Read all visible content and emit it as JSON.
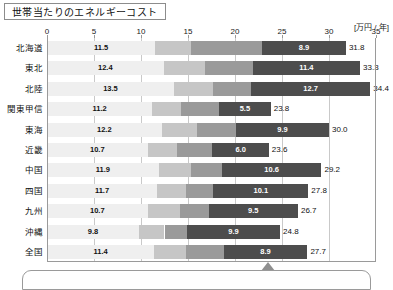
{
  "title": "世帯当たりのエネルギーコスト",
  "unit_label": "[万円 / 年]",
  "axis": {
    "ticks": [
      "0",
      "5",
      "10",
      "15",
      "20",
      "25",
      "30",
      "35"
    ],
    "min": 0,
    "max": 35
  },
  "chart_data": {
    "type": "bar",
    "orientation": "horizontal",
    "stacked": true,
    "title": "世帯当たりのエネルギーコスト",
    "xlabel": "[万円 / 年]",
    "ylabel": "",
    "xlim": [
      0,
      35
    ],
    "xticks": [
      0,
      5,
      10,
      15,
      20,
      25,
      30,
      35
    ],
    "grid": true,
    "categories": [
      "北海道",
      "東北",
      "北陸",
      "関東甲信",
      "東海",
      "近畿",
      "中国",
      "四国",
      "九州",
      "沖縄",
      "全国"
    ],
    "series": [
      {
        "name": "segment-1",
        "color": "#efefef",
        "values": [
          11.5,
          12.4,
          13.5,
          11.2,
          12.2,
          10.7,
          11.9,
          11.7,
          10.7,
          9.8,
          11.4
        ],
        "labeled": true
      },
      {
        "name": "segment-2",
        "color": "#c6c6c6",
        "values": [
          3.8,
          4.4,
          4.2,
          3.1,
          3.8,
          3.1,
          3.4,
          3.1,
          3.4,
          2.7,
          3.4
        ],
        "labeled": false
      },
      {
        "name": "segment-3",
        "color": "#9a9a9a",
        "values": [
          7.6,
          5.1,
          4.0,
          4.0,
          4.1,
          3.8,
          3.3,
          2.9,
          3.1,
          2.4,
          4.0
        ],
        "labeled": false
      },
      {
        "name": "segment-4",
        "color": "#4d4d4d",
        "values": [
          8.9,
          11.4,
          12.7,
          5.5,
          9.9,
          6.0,
          10.6,
          10.1,
          9.5,
          9.9,
          8.9
        ],
        "labeled": true
      }
    ],
    "totals": [
      31.8,
      33.3,
      34.4,
      23.8,
      30.0,
      23.6,
      29.2,
      27.8,
      26.7,
      24.8,
      27.7
    ],
    "total_labels": [
      "31.8",
      "33.3",
      "34.4",
      "23.8",
      "30.0",
      "23.6",
      "29.2",
      "27.8",
      "26.7",
      "24.8",
      "27.7"
    ]
  },
  "rows": [
    {
      "label": "北海道",
      "first": "11.5",
      "last": "8.9",
      "total": "31.8"
    },
    {
      "label": "東北",
      "first": "12.4",
      "last": "11.4",
      "total": "33.3"
    },
    {
      "label": "北陸",
      "first": "13.5",
      "last": "12.7",
      "total": "34.4"
    },
    {
      "label": "関東甲信",
      "first": "11.2",
      "last": "5.5",
      "total": "23.8"
    },
    {
      "label": "東海",
      "first": "12.2",
      "last": "9.9",
      "total": "30.0"
    },
    {
      "label": "近畿",
      "first": "10.7",
      "last": "6.0",
      "total": "23.6"
    },
    {
      "label": "中国",
      "first": "11.9",
      "last": "10.6",
      "total": "29.2"
    },
    {
      "label": "四国",
      "first": "11.7",
      "last": "10.1",
      "total": "27.8"
    },
    {
      "label": "九州",
      "first": "10.7",
      "last": "9.5",
      "total": "26.7"
    },
    {
      "label": "沖縄",
      "first": "9.8",
      "last": "9.9",
      "total": "24.8"
    },
    {
      "label": "全国",
      "first": "11.4",
      "last": "8.9",
      "total": "27.7"
    }
  ],
  "callout": {
    "pointer_at_value": 23.5
  }
}
